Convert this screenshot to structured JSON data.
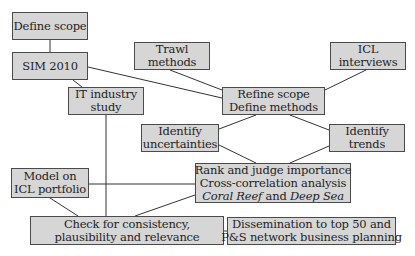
{
  "diagram": {
    "type": "flowchart",
    "colors": {
      "box_fill": "#d6d6d6",
      "box_border": "#4a4a4a",
      "line": "#333333",
      "background": "#ffffff"
    },
    "nodes": {
      "define_scope": {
        "lines": [
          "Define scope"
        ]
      },
      "sim_2010": {
        "lines": [
          "SIM 2010"
        ]
      },
      "trawl_methods": {
        "lines": [
          "Trawl",
          "methods"
        ]
      },
      "icl_interviews": {
        "lines": [
          "ICL",
          "interviews"
        ]
      },
      "it_industry_study": {
        "lines": [
          "IT industry",
          "study"
        ]
      },
      "refine_scope": {
        "lines": [
          "Refine scope",
          "Define methods"
        ]
      },
      "identify_uncertainties": {
        "lines": [
          "Identify",
          "uncertainties"
        ]
      },
      "identify_trends": {
        "lines": [
          "Identify",
          "trends"
        ]
      },
      "rank_judge": {
        "lines": [
          "Rank and judge importance",
          "Cross-correlation analysis"
        ],
        "line3": {
          "italic1": "Coral Reef",
          "connector": " and ",
          "italic2": "Deep Sea"
        }
      },
      "model_icl_portfolio": {
        "lines": [
          "Model on",
          "ICL portfolio"
        ]
      },
      "check_consistency": {
        "lines": [
          "Check for consistency,",
          "plausibility and relevance"
        ]
      },
      "dissemination": {
        "lines": [
          "Dissemination to top 50 and",
          "P&S network business planning"
        ]
      }
    },
    "edges": [
      [
        "Define scope",
        "SIM 2010"
      ],
      [
        "SIM 2010",
        "Refine scope / Define methods"
      ],
      [
        "SIM 2010",
        "IT industry study"
      ],
      [
        "Trawl methods",
        "Refine scope / Define methods"
      ],
      [
        "ICL interviews",
        "Refine scope / Define methods"
      ],
      [
        "Refine scope / Define methods",
        "Identify uncertainties"
      ],
      [
        "Refine scope / Define methods",
        "Identify trends"
      ],
      [
        "Identify uncertainties",
        "Rank and judge importance"
      ],
      [
        "Identify trends",
        "Rank and judge importance"
      ],
      [
        "IT industry study",
        "Check for consistency"
      ],
      [
        "Model on ICL portfolio",
        "Rank and judge importance"
      ],
      [
        "Model on ICL portfolio",
        "Check for consistency"
      ],
      [
        "Rank and judge importance",
        "Check for consistency"
      ],
      [
        "Check for consistency",
        "Dissemination"
      ]
    ]
  }
}
